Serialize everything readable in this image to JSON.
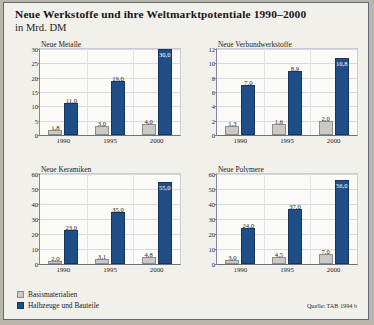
{
  "figure": {
    "title": "Neue Werkstoffe und ihre Weltmarktpotentiale 1990–2000",
    "subtitle": "in Mrd. DM",
    "source": "Quelle: TAB 1994 b"
  },
  "legend": {
    "items": [
      {
        "label": "Basismaterialien",
        "color": "#c9c9c5",
        "key": "base"
      },
      {
        "label": "Halbzeuge und Bauteile",
        "color": "#1f4e87",
        "key": "semi"
      }
    ]
  },
  "chart_data": [
    {
      "type": "bar",
      "title": "Neue Metalle",
      "xlabel": "",
      "ylabel": "",
      "categories": [
        "1990",
        "1995",
        "2000"
      ],
      "ylim": [
        0,
        30
      ],
      "yticks": [
        0,
        5,
        10,
        15,
        20,
        25,
        30
      ],
      "ytick_labels": [
        "0",
        "5",
        "10",
        "15",
        "20",
        "25",
        "30"
      ],
      "grid": true,
      "series": [
        {
          "name": "Basismaterialien",
          "values": [
            1.8,
            3.0,
            4.0
          ],
          "labels": [
            "1,8",
            "3,0",
            "4,0"
          ],
          "color": "#c9c9c5"
        },
        {
          "name": "Halbzeuge und Bauteile",
          "values": [
            11.0,
            19.0,
            30.0
          ],
          "labels": [
            "11,0",
            "19,0",
            "30,0"
          ],
          "color": "#1f4e87"
        }
      ]
    },
    {
      "type": "bar",
      "title": "Neue Verbundwerkstoffe",
      "xlabel": "",
      "ylabel": "",
      "categories": [
        "1990",
        "1995",
        "2000"
      ],
      "ylim": [
        0,
        12
      ],
      "yticks": [
        0,
        2,
        4,
        6,
        8,
        10,
        12
      ],
      "ytick_labels": [
        "0",
        "2",
        "4",
        "6",
        "8",
        "10",
        "12"
      ],
      "grid": true,
      "series": [
        {
          "name": "Basismaterialien",
          "values": [
            1.3,
            1.6,
            2.0
          ],
          "labels": [
            "1,3",
            "1,6",
            "2,0"
          ],
          "color": "#c9c9c5"
        },
        {
          "name": "Halbzeuge und Bauteile",
          "values": [
            7.0,
            8.9,
            10.8
          ],
          "labels": [
            "7,0",
            "8,9",
            "10,8"
          ],
          "color": "#1f4e87"
        }
      ]
    },
    {
      "type": "bar",
      "title": "Neue Keramiken",
      "xlabel": "",
      "ylabel": "",
      "categories": [
        "1990",
        "1995",
        "2000"
      ],
      "ylim": [
        0,
        60
      ],
      "yticks": [
        0,
        10,
        20,
        30,
        40,
        50,
        60
      ],
      "ytick_labels": [
        "0",
        "10",
        "20",
        "30",
        "40",
        "50",
        "60"
      ],
      "grid": true,
      "series": [
        {
          "name": "Basismaterialien",
          "values": [
            2.0,
            3.1,
            4.8
          ],
          "labels": [
            "2,0",
            "3,1",
            "4,8"
          ],
          "color": "#c9c9c5"
        },
        {
          "name": "Halbzeuge und Bauteile",
          "values": [
            23.0,
            35.0,
            55.0
          ],
          "labels": [
            "23,0",
            "35,0",
            "55,0"
          ],
          "color": "#1f4e87"
        }
      ]
    },
    {
      "type": "bar",
      "title": "Neue Polymere",
      "xlabel": "",
      "ylabel": "",
      "categories": [
        "1990",
        "1995",
        "2000"
      ],
      "ylim": [
        0,
        60
      ],
      "yticks": [
        0,
        10,
        20,
        30,
        40,
        50,
        60
      ],
      "ytick_labels": [
        "0",
        "10",
        "20",
        "30",
        "40",
        "50",
        "60"
      ],
      "grid": true,
      "series": [
        {
          "name": "Basismaterialien",
          "values": [
            3.0,
            4.5,
            7.0
          ],
          "labels": [
            "3,0",
            "4,5",
            "7,0"
          ],
          "color": "#c9c9c5"
        },
        {
          "name": "Halbzeuge und Bauteile",
          "values": [
            24.0,
            37.0,
            56.0
          ],
          "labels": [
            "24,0",
            "37,0",
            "56,0"
          ],
          "color": "#1f4e87"
        }
      ]
    }
  ]
}
